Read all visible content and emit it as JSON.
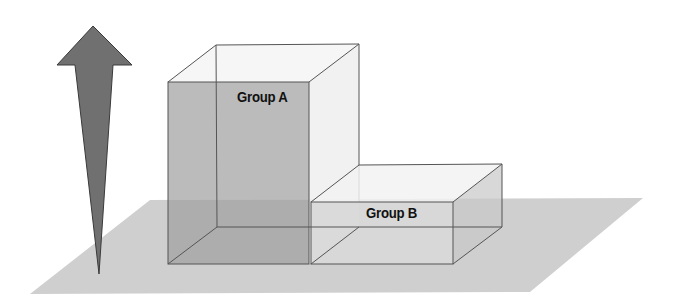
{
  "diagram": {
    "type": "3d-bar-comparison",
    "arrow": {
      "direction": "up",
      "meaning": "increasing value"
    },
    "groups": [
      {
        "label": "Group A",
        "relative_height": "tall"
      },
      {
        "label": "Group B",
        "relative_height": "short"
      }
    ]
  },
  "colors": {
    "background": "#ffffff",
    "floor": "#cfcfcf",
    "arrow_fill": "#707070",
    "arrow_stroke": "#3a3a3a",
    "box_a_front": "#b5b5b5",
    "box_a_side": "#eeeeee",
    "box_b_front": "#d8d8d8",
    "edge": "#555555"
  }
}
